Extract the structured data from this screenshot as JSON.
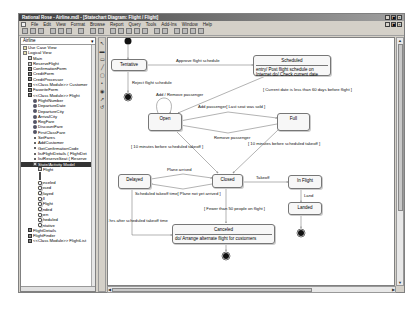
{
  "window": {
    "title": "Rational Rose - Airline.mdl - [Statechart Diagram: Flight / Flight]",
    "controls": [
      "_",
      "▣",
      "×"
    ],
    "child_controls": [
      "_",
      "▣",
      "×"
    ]
  },
  "menu": [
    "File",
    "Edit",
    "View",
    "Format",
    "Browse",
    "Report",
    "Query",
    "Tools",
    "Add-Ins",
    "Window",
    "Help"
  ],
  "toolbar": {
    "buttons": [
      "new",
      "open",
      "save",
      "sep",
      "cut",
      "copy",
      "paste",
      "sep",
      "print",
      "sep",
      "context-help",
      "view-doc",
      "sep",
      "browse-class",
      "browse-interaction",
      "browse-component",
      "browse-deployment",
      "browse-parent",
      "browse-previous",
      "sep",
      "zoom-in",
      "zoom-out",
      "fit",
      "undo-fit"
    ]
  },
  "browser": {
    "combo": "Airline",
    "items": [
      {
        "label": "Use Case View",
        "indent": 0,
        "icon": "folder"
      },
      {
        "label": "Logical View",
        "indent": 0,
        "icon": "folder"
      },
      {
        "label": "Main",
        "indent": 1,
        "icon": "diag"
      },
      {
        "label": "ReserveFlight",
        "indent": 1,
        "icon": "diag"
      },
      {
        "label": "ConfirmationForm",
        "indent": 1,
        "icon": "cls"
      },
      {
        "label": "CreditForm",
        "indent": 1,
        "icon": "cls"
      },
      {
        "label": "CreditProcessor",
        "indent": 1,
        "icon": "cls"
      },
      {
        "label": "<<Class Module>> Customer",
        "indent": 1,
        "icon": "cls"
      },
      {
        "label": "FavoriteForm",
        "indent": 1,
        "icon": "cls"
      },
      {
        "label": "<<Class Module>> Flight",
        "indent": 1,
        "icon": "cls"
      },
      {
        "label": "FlightNumber",
        "indent": 2,
        "icon": "attr"
      },
      {
        "label": "DepartureDate",
        "indent": 2,
        "icon": "attr"
      },
      {
        "label": "DepartureCity",
        "indent": 2,
        "icon": "attr"
      },
      {
        "label": "ArrivalCity",
        "indent": 2,
        "icon": "attr"
      },
      {
        "label": "RegFare",
        "indent": 2,
        "icon": "attr"
      },
      {
        "label": "DiscountFare",
        "indent": 2,
        "icon": "attr"
      },
      {
        "label": "FirstClassFare",
        "indent": 2,
        "icon": "attr"
      },
      {
        "label": "SetFares",
        "indent": 2,
        "icon": "op"
      },
      {
        "label": "AddCustomer",
        "indent": 2,
        "icon": "op"
      },
      {
        "label": "GetConfirmationCode",
        "indent": 2,
        "icon": "op"
      },
      {
        "label": "listFlightDetails ( FlightDet",
        "indent": 2,
        "icon": "op"
      },
      {
        "label": "listReserveSeat ( Reserve",
        "indent": 2,
        "icon": "op"
      },
      {
        "label": "State/Activity Model",
        "indent": 2,
        "icon": "diag",
        "selected": true
      },
      {
        "label": "Flight",
        "indent": 3,
        "icon": "diag"
      },
      {
        "label": "",
        "indent": 3,
        "icon": "dot"
      },
      {
        "label": "",
        "indent": 3,
        "icon": "dot"
      },
      {
        "label": "",
        "indent": 3,
        "icon": "dot"
      },
      {
        "label": "",
        "indent": 3,
        "icon": "dot"
      },
      {
        "label": "Canceled",
        "indent": 3,
        "icon": "state"
      },
      {
        "label": "Closed",
        "indent": 3,
        "icon": "state"
      },
      {
        "label": "Delayed",
        "indent": 3,
        "icon": "state"
      },
      {
        "label": "Full",
        "indent": 3,
        "icon": "state"
      },
      {
        "label": "In Flight",
        "indent": 3,
        "icon": "state"
      },
      {
        "label": "Landed",
        "indent": 3,
        "icon": "state"
      },
      {
        "label": "Open",
        "indent": 3,
        "icon": "state"
      },
      {
        "label": "Scheduled",
        "indent": 3,
        "icon": "state"
      },
      {
        "label": "Tentative",
        "indent": 3,
        "icon": "state"
      },
      {
        "label": "FlightDetails",
        "indent": 1,
        "icon": "cls"
      },
      {
        "label": "FlightFinder",
        "indent": 1,
        "icon": "cls"
      },
      {
        "label": "<<Class Module>> FlightList",
        "indent": 1,
        "icon": "cls"
      }
    ]
  },
  "diagram_toolbar": [
    "selection-arrow",
    "text-box",
    "note",
    "anchor-note",
    "state",
    "start-state",
    "end-state",
    "state-transition",
    "transition-to-self"
  ],
  "diagram": {
    "states": {
      "tentative": "Tentative",
      "scheduled": "Scheduled",
      "scheduled_action": "entry/ Post flight schedule on Internet do/ Check current date",
      "open": "Open",
      "full": "Full",
      "delayed": "Delayed",
      "closed": "Closed",
      "in_flight": "In Flight",
      "landed": "Landed",
      "canceled": "Canceled",
      "canceled_action": "do/ Arrange alternate flight for customers"
    },
    "transitions": {
      "approve": "Approve flight schedule",
      "reject": "Reject flight schedule",
      "add_remove": "Add / Remove passenger",
      "current_date": "[ Current date is less than 60 days before flight ]",
      "add_last_seat": "Add passenger[ Last seat was sold ]",
      "remove_passenger": "Remove passenger",
      "ten_min_open": "[ 10 minutes before scheduled takeoff ]",
      "ten_min_full": "[ 10 minutes before scheduled takeoff ]",
      "plane_arrived": "Plane arrived",
      "sched_takeoff": "Scheduled takeoff time[ Plane not yet arrived ]",
      "takeoff": "Takeoff",
      "land": "Land",
      "fewer": "[ Fewer than 50 people on flight ]",
      "four_hrs": "4 hrs after scheduled takeoff time"
    }
  }
}
